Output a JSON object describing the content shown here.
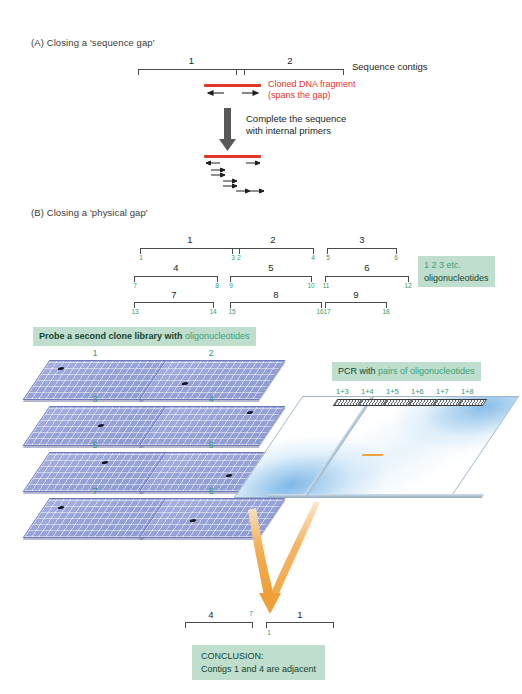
{
  "figure": {
    "panelA": {
      "title": "(A) Closing a 'sequence gap'",
      "contig_left_label": "1",
      "contig_right_label": "2",
      "contigs_label": "Sequence contigs",
      "fragment_label_line1": "Cloned DNA fragment",
      "fragment_label_line2": "(spans the gap)",
      "step_label_line1": "Complete the sequence",
      "step_label_line2": "with internal primers"
    },
    "panelB": {
      "title": "(B) Closing a 'physical gap'",
      "contig_map": {
        "columns": [
          {
            "rows": [
              {
                "contig": "1",
                "left_oligo": "1",
                "right_oligo": "2"
              },
              {
                "contig": "4",
                "left_oligo": "7",
                "right_oligo": "8"
              },
              {
                "contig": "7",
                "left_oligo": "13",
                "right_oligo": "14"
              }
            ]
          },
          {
            "rows": [
              {
                "contig": "2",
                "left_oligo": "3",
                "right_oligo": "4"
              },
              {
                "contig": "5",
                "left_oligo": "9",
                "right_oligo": "10"
              },
              {
                "contig": "8",
                "left_oligo": "15",
                "right_oligo": "16"
              }
            ]
          },
          {
            "rows": [
              {
                "contig": "3",
                "left_oligo": "5",
                "right_oligo": "6"
              },
              {
                "contig": "6",
                "left_oligo": "11",
                "right_oligo": "12"
              },
              {
                "contig": "9",
                "left_oligo": "17",
                "right_oligo": "18"
              }
            ]
          }
        ]
      },
      "oligo_legend_line1": "1 2 3 etc.",
      "oligo_legend_line2": "oligonucleotides",
      "probe_heading_main": "Probe a second clone library with ",
      "probe_heading_green": "oligonucleotides",
      "plates": [
        {
          "label": "1",
          "spot_x": 22,
          "spot_y": 7
        },
        {
          "label": "2",
          "spot_x": 30,
          "spot_y": 22
        },
        {
          "label": "3",
          "spot_x": 62,
          "spot_y": 18
        },
        {
          "label": "4",
          "spot_x": 95,
          "spot_y": 5
        },
        {
          "label": "5",
          "spot_x": 66,
          "spot_y": 9
        },
        {
          "label": "6",
          "spot_x": 74,
          "spot_y": 22
        },
        {
          "label": "7",
          "spot_x": 22,
          "spot_y": 8
        },
        {
          "label": "8",
          "spot_x": 38,
          "spot_y": 21
        }
      ],
      "pcr_heading_main": "PCR with ",
      "pcr_heading_green": "pairs of oligonucleotides",
      "gel_lanes": [
        "1+3",
        "1+4",
        "1+5",
        "1+6",
        "1+7",
        "1+8"
      ],
      "conclusion_result": {
        "left_contig": "4",
        "left_oligo": "7",
        "right_contig": "1",
        "right_oligo": "1"
      },
      "conclusion_line1": "CONCLUSION:",
      "conclusion_line2": "Contigs 1 and 4 are adjacent"
    }
  },
  "colors": {
    "red_fragment": "#e2352b",
    "green_text": "#2e9c6a",
    "green_box_bg": "#bfdecd",
    "plate_blue": "#97a3d8",
    "band_orange": "#f0a33c"
  }
}
